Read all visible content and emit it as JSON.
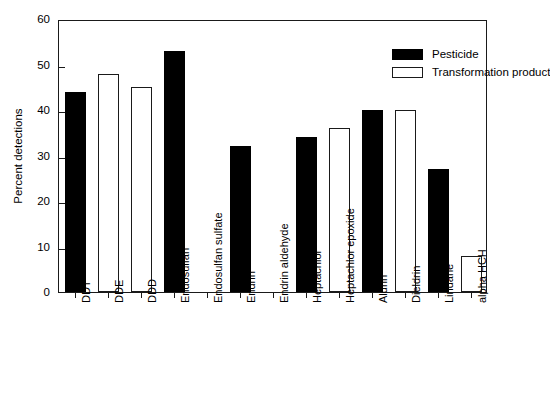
{
  "chart_data": {
    "type": "bar",
    "title": "",
    "xlabel": "",
    "ylabel": "Percent detections",
    "ylim": [
      0,
      60
    ],
    "yticks": [
      0,
      10,
      20,
      30,
      40,
      50,
      60
    ],
    "grid": false,
    "legend_position": "top-right",
    "categories": [
      "DDT",
      "DDE",
      "DDD",
      "Endosulfan",
      "Endosulfan sulfate",
      "Endrin",
      "Endrin aldehyde",
      "Heptachlor",
      "Heptachlor epoxide",
      "Aldrin",
      "Dieldrin",
      "Lindane",
      "alpha HCH"
    ],
    "values": [
      44,
      48,
      45,
      53,
      0,
      32,
      0,
      34,
      36,
      40,
      40,
      27,
      8
    ],
    "bar_types": [
      "pesticide",
      "transformation",
      "transformation",
      "pesticide",
      "transformation",
      "pesticide",
      "transformation",
      "pesticide",
      "transformation",
      "pesticide",
      "transformation",
      "pesticide",
      "transformation"
    ],
    "series": [
      {
        "name": "Pesticide",
        "color": "#000000",
        "points": [
          {
            "category": "DDT",
            "value": 44
          },
          {
            "category": "Endosulfan",
            "value": 53
          },
          {
            "category": "Endrin",
            "value": 32
          },
          {
            "category": "Heptachlor",
            "value": 34
          },
          {
            "category": "Aldrin",
            "value": 40
          },
          {
            "category": "Lindane",
            "value": 27
          }
        ]
      },
      {
        "name": "Transformation product",
        "color": "#ffffff",
        "points": [
          {
            "category": "DDE",
            "value": 48
          },
          {
            "category": "DDD",
            "value": 45
          },
          {
            "category": "Endosulfan sulfate",
            "value": 0
          },
          {
            "category": "Endrin aldehyde",
            "value": 0
          },
          {
            "category": "Heptachlor epoxide",
            "value": 36
          },
          {
            "category": "Dieldrin",
            "value": 40
          },
          {
            "category": "alpha HCH",
            "value": 8
          }
        ]
      }
    ]
  },
  "legend": {
    "items": [
      {
        "label": "Pesticide",
        "kind": "pesticide"
      },
      {
        "label": "Transformation product",
        "kind": "transformation"
      }
    ]
  }
}
